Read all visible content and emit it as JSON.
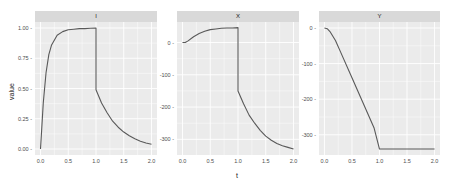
{
  "chart_data": {
    "type": "line",
    "title": "",
    "xlabel": "t",
    "ylabel": "value",
    "grid": true,
    "facets": [
      {
        "label": "I",
        "xlim": [
          0,
          2
        ],
        "ylim": [
          0,
          1
        ],
        "xticks": [
          "0.0",
          "0.5",
          "1.0",
          "1.5",
          "2.0"
        ],
        "yticks": [
          "0.00",
          "0.25",
          "0.50",
          "0.75",
          "1.00"
        ],
        "x": [
          0.0,
          0.02,
          0.05,
          0.1,
          0.15,
          0.2,
          0.3,
          0.4,
          0.5,
          0.6,
          0.7,
          0.8,
          0.9,
          1.0,
          1.0,
          1.1,
          1.2,
          1.3,
          1.4,
          1.5,
          1.6,
          1.7,
          1.8,
          1.9,
          2.0
        ],
        "values": [
          0.0,
          0.15,
          0.38,
          0.63,
          0.78,
          0.86,
          0.94,
          0.97,
          0.985,
          0.99,
          0.995,
          0.995,
          0.998,
          1.0,
          0.49,
          0.38,
          0.3,
          0.23,
          0.18,
          0.14,
          0.11,
          0.085,
          0.065,
          0.05,
          0.04
        ]
      },
      {
        "label": "X",
        "xlim": [
          0,
          2
        ],
        "ylim": [
          -330,
          45
        ],
        "xticks": [
          "0.0",
          "0.5",
          "1.0",
          "1.5",
          "2.0"
        ],
        "yticks": [
          "-300",
          "-200",
          "-100",
          "0"
        ],
        "x": [
          0.0,
          0.05,
          0.1,
          0.2,
          0.3,
          0.4,
          0.5,
          0.6,
          0.7,
          0.8,
          0.9,
          1.0,
          1.0,
          1.1,
          1.2,
          1.3,
          1.4,
          1.5,
          1.6,
          1.7,
          1.8,
          1.9,
          2.0
        ],
        "values": [
          0,
          0,
          5,
          18,
          28,
          35,
          40,
          42,
          44,
          45,
          45,
          46,
          -150,
          -190,
          -225,
          -250,
          -272,
          -290,
          -303,
          -313,
          -320,
          -325,
          -330
        ]
      },
      {
        "label": "Y",
        "xlim": [
          0,
          2
        ],
        "ylim": [
          -340,
          0
        ],
        "xticks": [
          "0.0",
          "0.5",
          "1.0",
          "1.5",
          "2.0"
        ],
        "yticks": [
          "-300",
          "-200",
          "-100",
          "0"
        ],
        "x": [
          0.0,
          0.05,
          0.1,
          0.2,
          0.3,
          0.5,
          0.7,
          0.9,
          1.0,
          1.5,
          2.0
        ],
        "values": [
          0,
          -2,
          -10,
          -35,
          -70,
          -140,
          -210,
          -280,
          -340,
          -340,
          -340
        ]
      }
    ]
  },
  "axes": {
    "xlabel": "t",
    "ylabel": "value"
  },
  "colors": {
    "panel_bg": "#ebebeb",
    "strip_bg": "#d9d9d9",
    "grid": "#ffffff",
    "line": "#595959"
  }
}
